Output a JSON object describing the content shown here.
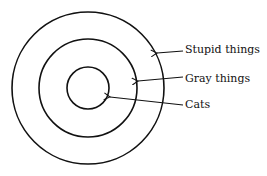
{
  "diagram": {
    "type": "concentric-circles",
    "stroke_color": "#111111",
    "background": "#ffffff",
    "circles": [
      {
        "name": "outer",
        "label": "Stupid things",
        "cx": 88,
        "cy": 88,
        "r": 76
      },
      {
        "name": "middle",
        "label": "Gray things",
        "cx": 88,
        "cy": 88,
        "r": 49
      },
      {
        "name": "inner",
        "label": "Cats",
        "cx": 88,
        "cy": 88,
        "r": 21
      }
    ],
    "labels": {
      "outer": "Stupid things",
      "middle": "Gray things",
      "inner": "Cats"
    }
  }
}
